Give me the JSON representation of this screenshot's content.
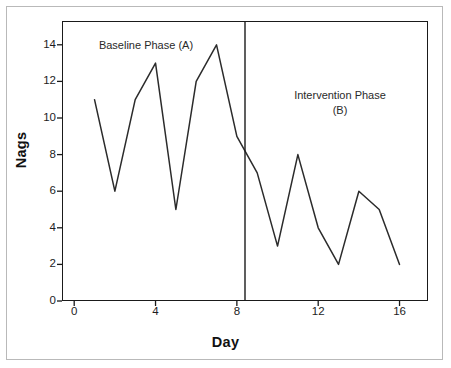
{
  "figure": {
    "background_color": "#ffffff",
    "frame_color": "#b9b9b9",
    "axis_color": "#1a1a1a",
    "line_color": "#2b2b2b"
  },
  "annotations": {
    "baseline": "Baseline Phase (A)",
    "intervention": "Intervention Phase\n(B)"
  },
  "chart_data": {
    "type": "line",
    "title": "",
    "subtitle": "",
    "xlabel": "Day",
    "ylabel": "Nags",
    "xlim": [
      -0.6,
      17.4
    ],
    "ylim": [
      0,
      15.3
    ],
    "xticks": [
      0,
      4,
      8,
      12,
      16
    ],
    "xticklabels": [
      "0",
      "4",
      "8",
      "12",
      "16"
    ],
    "yticks": [
      0,
      2,
      4,
      6,
      8,
      10,
      12,
      14
    ],
    "yticklabels": [
      "0",
      "2",
      "4",
      "6",
      "8",
      "10",
      "12",
      "14"
    ],
    "grid": false,
    "legend": "none",
    "series": [
      {
        "name": "Nags per day",
        "x": [
          1,
          2,
          3,
          4,
          5,
          6,
          7,
          8,
          9,
          10,
          11,
          12,
          13,
          14,
          15,
          16
        ],
        "values": [
          11,
          6,
          11,
          13,
          5,
          12,
          14,
          9,
          7,
          3,
          8,
          4,
          2,
          6,
          5,
          2
        ]
      }
    ],
    "phases": [
      {
        "label": "Baseline Phase (A)",
        "x_range": [
          1,
          8
        ],
        "values": [
          11,
          6,
          11,
          13,
          5,
          12,
          14,
          9
        ]
      },
      {
        "label": "Intervention Phase (B)",
        "x_range": [
          9,
          16
        ],
        "values": [
          7,
          3,
          8,
          4,
          2,
          6,
          5,
          2
        ]
      }
    ],
    "phase_line_x": 8.4,
    "annotations": [
      {
        "text": "Baseline Phase (A)",
        "x": 3.0,
        "y": 14.2
      },
      {
        "text": "Intervention Phase (B)",
        "x": 12.6,
        "y": 11.5
      }
    ]
  }
}
